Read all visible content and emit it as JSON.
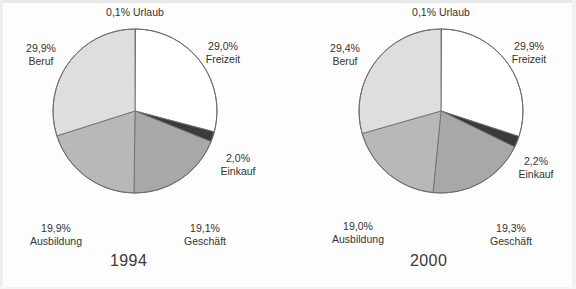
{
  "colors": {
    "background": "#fdfdfd",
    "text": "#333333",
    "slice_urlaub": "#ffffff",
    "slice_freizeit": "#ffffff",
    "slice_einkauf": "#3a3a3a",
    "slice_geschaeft": "#a8a8a8",
    "slice_ausbildung": "#b8b8b8",
    "slice_beruf": "#dedede",
    "slice_outline": "#6e6e6e"
  },
  "chart_data": [
    {
      "type": "pie",
      "title": "1994",
      "xlabel": "",
      "ylabel": "",
      "legend_position": "none",
      "grid": false,
      "categories": [
        "Urlaub",
        "Freizeit",
        "Einkauf",
        "Geschäft",
        "Ausbildung",
        "Beruf"
      ],
      "values": [
        0.1,
        29.0,
        2.0,
        19.1,
        19.9,
        29.9
      ],
      "labels": [
        "0,1%",
        "29,0%",
        "2,0%",
        "19,1%",
        "19,9%",
        "29,9%"
      ],
      "slice_colors": [
        "#ffffff",
        "#ffffff",
        "#3a3a3a",
        "#a8a8a8",
        "#b8b8b8",
        "#dedede"
      ],
      "start_angle_deg": 0,
      "direction": "clockwise"
    },
    {
      "type": "pie",
      "title": "2000",
      "xlabel": "",
      "ylabel": "",
      "legend_position": "none",
      "grid": false,
      "categories": [
        "Urlaub",
        "Freizeit",
        "Einkauf",
        "Geschäft",
        "Ausbildung",
        "Beruf"
      ],
      "values": [
        0.1,
        29.9,
        2.2,
        19.3,
        19.0,
        29.4
      ],
      "labels": [
        "0,1%",
        "29,9%",
        "2,2%",
        "19,3%",
        "19,0%",
        "29,4%"
      ],
      "slice_colors": [
        "#ffffff",
        "#ffffff",
        "#3a3a3a",
        "#a8a8a8",
        "#b8b8b8",
        "#dedede"
      ],
      "start_angle_deg": 0,
      "direction": "clockwise"
    }
  ],
  "charts": [
    {
      "year": "1994",
      "labels": {
        "urlaub": {
          "pct": "0,1%",
          "cat": "Urlaub",
          "combined": "0,1% Urlaub"
        },
        "freizeit": {
          "pct": "29,0%",
          "cat": "Freizeit"
        },
        "einkauf": {
          "pct": "2,0%",
          "cat": "Einkauf"
        },
        "geschaeft": {
          "pct": "19,1%",
          "cat": "Geschäft"
        },
        "ausbildung": {
          "pct": "19,9%",
          "cat": "Ausbildung"
        },
        "beruf": {
          "pct": "29,9%",
          "cat": "Beruf"
        }
      }
    },
    {
      "year": "2000",
      "labels": {
        "urlaub": {
          "pct": "0,1%",
          "cat": "Urlaub",
          "combined": "0,1% Urlaub"
        },
        "freizeit": {
          "pct": "29,9%",
          "cat": "Freizeit"
        },
        "einkauf": {
          "pct": "2,2%",
          "cat": "Einkauf"
        },
        "geschaeft": {
          "pct": "19,3%",
          "cat": "Geschäft"
        },
        "ausbildung": {
          "pct": "19,0%",
          "cat": "Ausbildung"
        },
        "beruf": {
          "pct": "29,4%",
          "cat": "Beruf"
        }
      }
    }
  ]
}
